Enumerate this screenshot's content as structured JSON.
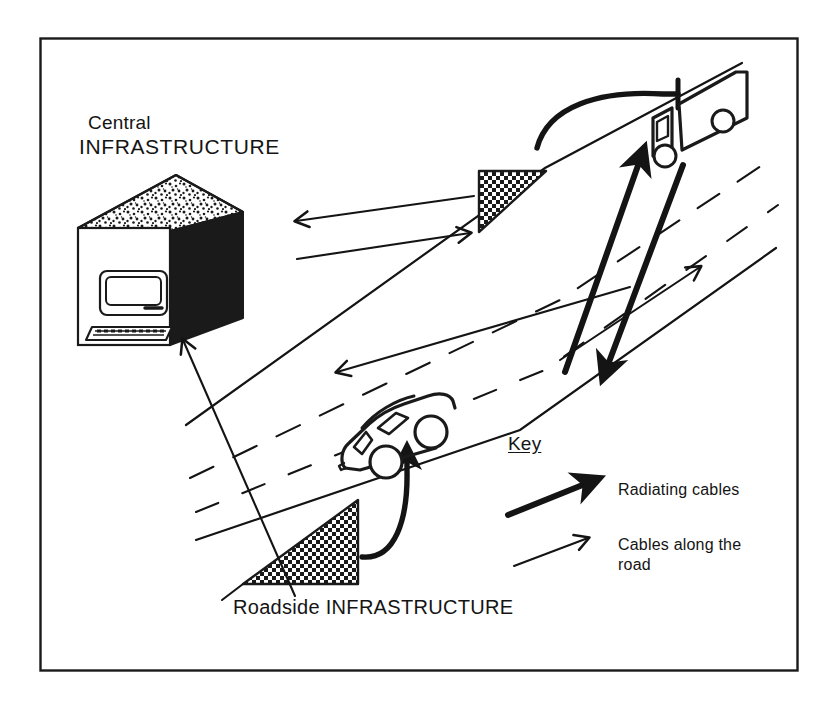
{
  "figure": {
    "type": "schematic-diagram",
    "frame": {
      "color": "#1a1a1a"
    },
    "ink_color": "#141414"
  },
  "labels": {
    "central_line1": "Central",
    "central_line2": "INFRASTRUCTURE",
    "roadside": "Roadside INFRASTRUCTURE"
  },
  "key": {
    "title": "Key",
    "entries": [
      {
        "label": "Radiating cables",
        "style": "thick-arrow"
      },
      {
        "label": "Cables along the\nroad",
        "style": "thin-arrow"
      }
    ]
  },
  "key_entry_labels": {
    "radiating": "Radiating cables",
    "cables_along_road": "Cables along the\nroad"
  },
  "elements": {
    "building": "central-infrastructure-building",
    "computer": "computer-workstation",
    "truck": "lorry-vehicle",
    "car": "car-vehicle",
    "roadside_cabinet_upper": "roadside-infrastructure-upper",
    "roadside_cabinet_lower": "roadside-infrastructure-lower",
    "road": "road-carriageway"
  }
}
